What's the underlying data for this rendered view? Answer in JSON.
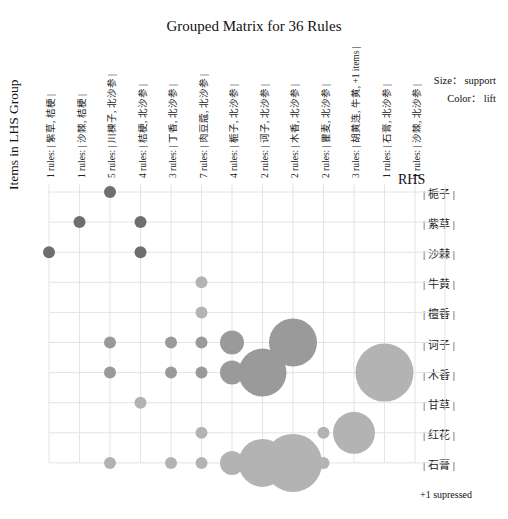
{
  "chart_data": {
    "type": "scatter",
    "subtype": "grouped-matrix-bubble",
    "title": "Grouped Matrix for 36 Rules",
    "xlabel": "Items in LHS Group",
    "ylabel": "RHS",
    "legend": {
      "size": "Size： support",
      "color": "Color： lift"
    },
    "footnote": "+1 supressed",
    "grid": true,
    "lhs_groups": [
      "1 rules: | 紫草, 桔梗 |",
      "1 rules: | 沙棘, 桔梗 |",
      "5 rules: | 川楝子, 北沙参 |",
      "4 rules: | 桔梗, 北沙参 |",
      "3 rules: | 丁香, 北沙参 |",
      "7 rules: | 肉豆蔻, 北沙参 |",
      "4 rules: | 栀子, 北沙参 |",
      "2 rules: | 诃子, 北沙参 |",
      "2 rules: | 木香, 北沙参 |",
      "2 rules: | 瞿麦, 北沙参 |",
      "3 rules: | 胡黄连, 牛黄, +1 items |",
      "1 rules: | 石膏, 北沙参 |",
      "1 rules: | 沙棘, 北沙参 |"
    ],
    "rhs_items": [
      "| 栀子 |",
      "| 紫草 |",
      "| 沙棘 |",
      "| 牛黄 |",
      "| 檀香 |",
      "| 诃子 |",
      "| 木香 |",
      "| 甘草 |",
      "| 红花 |",
      "| 石膏 |"
    ],
    "points": [
      {
        "col": 2,
        "row": 0,
        "size": 6,
        "lift_level": "high"
      },
      {
        "col": 1,
        "row": 1,
        "size": 6,
        "lift_level": "high"
      },
      {
        "col": 3,
        "row": 1,
        "size": 6,
        "lift_level": "high"
      },
      {
        "col": 0,
        "row": 2,
        "size": 6,
        "lift_level": "high"
      },
      {
        "col": 3,
        "row": 2,
        "size": 6,
        "lift_level": "high"
      },
      {
        "col": 5,
        "row": 3,
        "size": 6,
        "lift_level": "low"
      },
      {
        "col": 5,
        "row": 4,
        "size": 6,
        "lift_level": "low"
      },
      {
        "col": 2,
        "row": 5,
        "size": 6,
        "lift_level": "mid"
      },
      {
        "col": 4,
        "row": 5,
        "size": 6,
        "lift_level": "mid"
      },
      {
        "col": 5,
        "row": 5,
        "size": 6,
        "lift_level": "mid"
      },
      {
        "col": 6,
        "row": 5,
        "size": 12,
        "lift_level": "mid"
      },
      {
        "col": 8,
        "row": 5,
        "size": 24,
        "lift_level": "mid"
      },
      {
        "col": 2,
        "row": 6,
        "size": 6,
        "lift_level": "mid"
      },
      {
        "col": 4,
        "row": 6,
        "size": 6,
        "lift_level": "mid"
      },
      {
        "col": 5,
        "row": 6,
        "size": 6,
        "lift_level": "mid"
      },
      {
        "col": 6,
        "row": 6,
        "size": 12,
        "lift_level": "mid"
      },
      {
        "col": 7,
        "row": 6,
        "size": 24,
        "lift_level": "mid"
      },
      {
        "col": 11,
        "row": 6,
        "size": 29,
        "lift_level": "low"
      },
      {
        "col": 3,
        "row": 7,
        "size": 6,
        "lift_level": "low"
      },
      {
        "col": 5,
        "row": 8,
        "size": 6,
        "lift_level": "low"
      },
      {
        "col": 9,
        "row": 8,
        "size": 6,
        "lift_level": "low"
      },
      {
        "col": 10,
        "row": 8,
        "size": 21,
        "lift_level": "low"
      },
      {
        "col": 2,
        "row": 9,
        "size": 6,
        "lift_level": "low"
      },
      {
        "col": 4,
        "row": 9,
        "size": 6,
        "lift_level": "low"
      },
      {
        "col": 5,
        "row": 9,
        "size": 6,
        "lift_level": "low"
      },
      {
        "col": 6,
        "row": 9,
        "size": 12,
        "lift_level": "low"
      },
      {
        "col": 7,
        "row": 9,
        "size": 24,
        "lift_level": "low"
      },
      {
        "col": 8,
        "row": 9,
        "size": 29,
        "lift_level": "low"
      },
      {
        "col": 9,
        "row": 9,
        "size": 6,
        "lift_level": "low"
      }
    ],
    "colors": {
      "high": "#6e6e6e",
      "mid": "#9a9a9a",
      "low": "#b3b3b3",
      "grid": "#e4e4e4"
    }
  }
}
